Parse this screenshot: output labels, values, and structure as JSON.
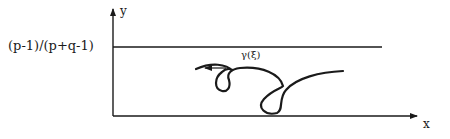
{
  "diagram": {
    "type": "coordinate-plot",
    "axes": {
      "x_label": "x",
      "y_label": "y"
    },
    "horizontal_line": {
      "label": "(p-1)/(p+q-1)"
    },
    "curve": {
      "label": "γ(ξ)",
      "description": "Curve with two loops, lying below the horizontal line, arrow pointing left at its end"
    },
    "colors": {
      "ink": "#1a1a1a",
      "background": "#ffffff"
    }
  }
}
